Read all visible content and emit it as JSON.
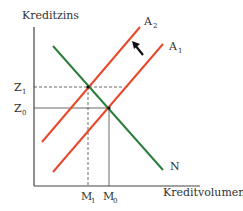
{
  "diagram": {
    "y_axis_label": "Kreditzins",
    "x_axis_label": "Kreditvolumen",
    "curves": {
      "supply_1": {
        "label": "A",
        "sub": "1",
        "color": "#e8472b"
      },
      "supply_2": {
        "label": "A",
        "sub": "2",
        "color": "#e8472b"
      },
      "demand": {
        "label": "N",
        "color": "#2e7d3e"
      }
    },
    "y_ticks": [
      {
        "label": "Z",
        "sub": "1"
      },
      {
        "label": "Z",
        "sub": "0"
      }
    ],
    "x_ticks": [
      {
        "label": "M",
        "sub": "1"
      },
      {
        "label": "M",
        "sub": "0"
      }
    ],
    "annotation": "arrow-shift-left"
  }
}
